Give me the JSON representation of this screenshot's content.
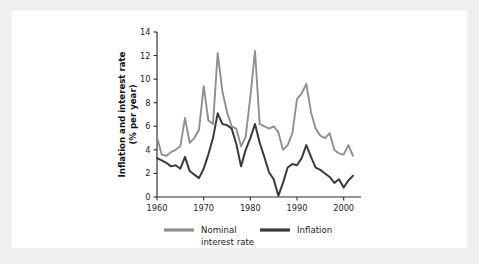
{
  "figure": {
    "panel_background": "#ffffff",
    "outer_background": "#efefef"
  },
  "chart_data": {
    "type": "line",
    "title": "",
    "xlabel": "",
    "ylabel": "Inflation and interest rate",
    "ylabel_line2": "(% per year)",
    "xlim": [
      1960,
      2002
    ],
    "ylim": [
      0,
      14
    ],
    "grid": false,
    "legend_position": "bottom",
    "xticks": [
      1960,
      1970,
      1980,
      1990,
      2000
    ],
    "xtick_labels": [
      "1960",
      "1970",
      "1980",
      "1990",
      "2000"
    ],
    "yticks": [
      0,
      2,
      4,
      6,
      8,
      10,
      12,
      14
    ],
    "ytick_labels": [
      "0",
      "2",
      "4",
      "6",
      "8",
      "10",
      "12",
      "14"
    ],
    "colors": {
      "nominal_interest_rate": "#8f8f8f",
      "inflation": "#3a3a3a",
      "axis": "#2b2b2b",
      "text": "#1d1d1d"
    },
    "x": [
      1960,
      1961,
      1962,
      1963,
      1964,
      1965,
      1966,
      1967,
      1968,
      1969,
      1970,
      1971,
      1972,
      1973,
      1974,
      1975,
      1976,
      1977,
      1978,
      1979,
      1980,
      1981,
      1982,
      1983,
      1984,
      1985,
      1986,
      1987,
      1988,
      1989,
      1990,
      1991,
      1992,
      1993,
      1994,
      1995,
      1996,
      1997,
      1998,
      1999,
      2000,
      2001,
      2002
    ],
    "series": [
      {
        "name": "Nominal interest rate",
        "color": "#8f8f8f",
        "values": [
          5.1,
          3.6,
          3.5,
          3.8,
          4.0,
          4.3,
          6.7,
          4.6,
          5.0,
          5.7,
          9.4,
          6.5,
          6.2,
          12.2,
          9.0,
          7.2,
          6.0,
          5.8,
          4.3,
          5.1,
          8.5,
          12.4,
          6.2,
          6.0,
          5.8,
          6.0,
          5.5,
          4.0,
          4.4,
          5.4,
          8.3,
          8.8,
          9.6,
          7.2,
          5.8,
          5.2,
          5.0,
          5.4,
          4.0,
          3.7,
          3.6,
          4.4,
          3.5
        ]
      },
      {
        "name": "Inflation",
        "color": "#3a3a3a",
        "values": [
          3.3,
          3.1,
          2.9,
          2.6,
          2.7,
          2.4,
          3.4,
          2.2,
          1.9,
          1.6,
          2.4,
          3.6,
          5.0,
          7.1,
          6.2,
          6.1,
          5.8,
          4.5,
          2.6,
          4.0,
          5.0,
          6.2,
          4.6,
          3.4,
          2.1,
          1.5,
          0.1,
          1.2,
          2.5,
          2.8,
          2.7,
          3.3,
          4.4,
          3.4,
          2.5,
          2.3,
          2.0,
          1.7,
          1.2,
          1.5,
          0.8,
          1.4,
          1.8
        ]
      }
    ],
    "legend": [
      {
        "label": "Nominal",
        "label_line2": "interest rate",
        "color": "#8f8f8f"
      },
      {
        "label": "Inflation",
        "label_line2": "",
        "color": "#3a3a3a"
      }
    ]
  }
}
